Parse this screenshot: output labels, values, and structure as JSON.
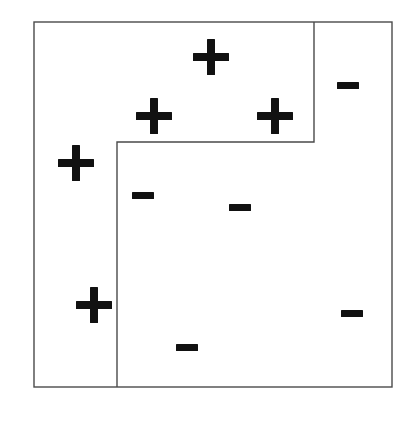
{
  "figure": {
    "width": 416,
    "height": 422,
    "background_color": "#ffffff",
    "line_color": "#4a4a4a",
    "marker_color": "#111111"
  },
  "plot_frame": {
    "name": "outer-box",
    "left": 34,
    "top": 22,
    "right": 392,
    "bottom": 387,
    "stroke_width": 1.4
  },
  "decision_boundary": {
    "name": "step-boundary",
    "stroke_width": 1.4,
    "description": "Staircase partition: vertical drop at x=314 from top edge to y=142, horizontal run left to x=117, then vertical drop to bottom edge.",
    "segments": [
      {
        "id": "seg-right-vertical",
        "orientation": "vertical",
        "x1": 314,
        "y1": 22,
        "x2": 314,
        "y2": 142
      },
      {
        "id": "seg-mid-horizontal",
        "orientation": "horizontal",
        "x1": 117,
        "y1": 142,
        "x2": 314,
        "y2": 142
      },
      {
        "id": "seg-left-vertical",
        "orientation": "vertical",
        "x1": 117,
        "y1": 142,
        "x2": 117,
        "y2": 387
      }
    ]
  },
  "markers": {
    "plus_label": "+",
    "minus_label": "−",
    "plus_count": 5,
    "minus_count": 6,
    "plus_points": [
      {
        "id": "plus-1",
        "label": "+",
        "cx": 211,
        "cy": 57,
        "size": 36,
        "thickness": 8
      },
      {
        "id": "plus-2",
        "label": "+",
        "cx": 154,
        "cy": 116,
        "size": 36,
        "thickness": 8
      },
      {
        "id": "plus-3",
        "label": "+",
        "cx": 275,
        "cy": 116,
        "size": 36,
        "thickness": 8
      },
      {
        "id": "plus-4",
        "label": "+",
        "cx": 76,
        "cy": 163,
        "size": 36,
        "thickness": 8
      },
      {
        "id": "plus-5",
        "label": "+",
        "cx": 94,
        "cy": 305,
        "size": 36,
        "thickness": 8
      }
    ],
    "minus_points": [
      {
        "id": "minus-1",
        "label": "−",
        "cx": 348,
        "cy": 85,
        "width": 22,
        "thickness": 7
      },
      {
        "id": "minus-2",
        "label": "−",
        "cx": 143,
        "cy": 195,
        "width": 22,
        "thickness": 7
      },
      {
        "id": "minus-3",
        "label": "−",
        "cx": 240,
        "cy": 207,
        "width": 22,
        "thickness": 7
      },
      {
        "id": "minus-4",
        "label": "−",
        "cx": 352,
        "cy": 313,
        "width": 22,
        "thickness": 7
      },
      {
        "id": "minus-5",
        "label": "−",
        "cx": 187,
        "cy": 347,
        "width": 22,
        "thickness": 7
      }
    ]
  },
  "chart_data": {
    "type": "scatter",
    "title": "",
    "xlabel": "",
    "ylabel": "",
    "grid": false,
    "legend": "none",
    "xlim": [
      34,
      392
    ],
    "ylim": [
      22,
      387
    ],
    "series": [
      {
        "name": "+",
        "marker": "plus",
        "values": [
          [
            211,
            57
          ],
          [
            154,
            116
          ],
          [
            275,
            116
          ],
          [
            76,
            163
          ],
          [
            94,
            305
          ]
        ]
      },
      {
        "name": "−",
        "marker": "minus",
        "values": [
          [
            348,
            85
          ],
          [
            143,
            195
          ],
          [
            240,
            207
          ],
          [
            352,
            313
          ],
          [
            187,
            347
          ]
        ]
      }
    ],
    "annotations": [
      {
        "type": "step-boundary",
        "text": "",
        "path": [
          [
            314,
            22
          ],
          [
            314,
            142
          ],
          [
            117,
            142
          ],
          [
            117,
            387
          ]
        ]
      }
    ]
  }
}
